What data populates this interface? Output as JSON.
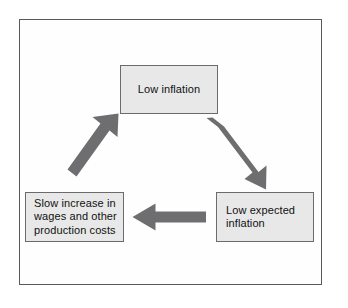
{
  "figure": {
    "type": "cycle-diagram",
    "orientation": "clockwise",
    "frame_border_color": "#58585a",
    "background_color": "#ffffff"
  },
  "style": {
    "node_fill": "#e8e8e8",
    "node_border": "#6b6b6d",
    "arrow_color": "#6e6e70",
    "text_color": "#111111"
  },
  "nodes": [
    {
      "id": "low-inflation",
      "label": "Low inflation",
      "position": "top"
    },
    {
      "id": "low-expected-inflation",
      "label": "Low expected\ninflation",
      "position": "bottom-right"
    },
    {
      "id": "slow-increase",
      "label": "Slow increase in\nwages and other\nproduction costs",
      "position": "bottom-left"
    }
  ],
  "arrows": [
    {
      "id": "low-inflation-to-low-expected-inflation",
      "from": "low-inflation",
      "to": "low-expected-inflation",
      "direction": "down-right"
    },
    {
      "id": "low-expected-inflation-to-slow-increase",
      "from": "low-expected-inflation",
      "to": "slow-increase",
      "direction": "left"
    },
    {
      "id": "slow-increase-to-low-inflation",
      "from": "slow-increase",
      "to": "low-inflation",
      "direction": "up-right"
    }
  ]
}
